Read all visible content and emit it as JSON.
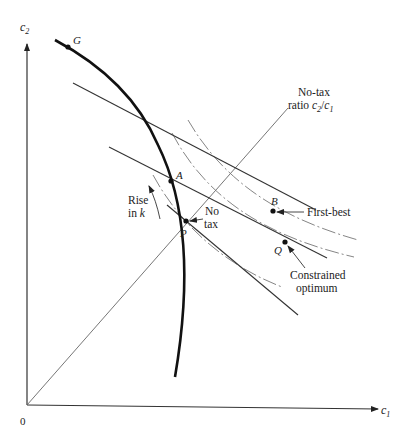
{
  "diagram": {
    "axes": {
      "y_label": "c",
      "y_sub": "2",
      "x_label": "c",
      "x_sub": "1",
      "origin_label": "0"
    },
    "points": {
      "G": "G",
      "A": "A",
      "P": "P",
      "B": "B",
      "Q": "Q"
    },
    "annotations": {
      "ray_line1": "No-tax",
      "ray_line2_prefix": "ratio ",
      "ray_c2": "c",
      "ray_c2_sub": "2",
      "ray_slash": "/",
      "ray_c1": "c",
      "ray_c1_sub": "1",
      "rise_line1": "Rise",
      "rise_line2_prefix": "in ",
      "rise_k": "k",
      "notax_line1": "No",
      "notax_line2": "tax",
      "first_best": "First-best",
      "constrained_line1": "Constrained",
      "constrained_line2": "optimum"
    }
  }
}
